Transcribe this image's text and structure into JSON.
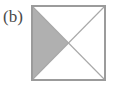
{
  "figure": {
    "panel_label": "(b)",
    "background_color": "#ffffff",
    "caption_color": "#4a4a4a"
  },
  "diagram": {
    "shape_name": "square",
    "outline_color": "#9b9b9b",
    "diagonal_color": "#a8a8a8",
    "fill_color": "#ffffff",
    "shaded_fill_color": "#b0b0b0",
    "outline_width": 2,
    "diagonal_width": 1,
    "square": {
      "left": 32,
      "top": 6,
      "right": 105,
      "bottom": 80
    },
    "center": {
      "x": 68.5,
      "y": 43
    },
    "corners": [
      {
        "name": "top-left",
        "x": 32,
        "y": 6
      },
      {
        "name": "top-right",
        "x": 105,
        "y": 6
      },
      {
        "name": "bottom-right",
        "x": 105,
        "y": 80
      },
      {
        "name": "bottom-left",
        "x": 32,
        "y": 80
      }
    ],
    "regions": [
      {
        "name": "left-triangle",
        "shaded": true,
        "points": "32,6 68.5,43 32,80"
      },
      {
        "name": "top-triangle",
        "shaded": false,
        "points": "32,6 105,6 68.5,43"
      },
      {
        "name": "right-triangle",
        "shaded": false,
        "points": "105,6 105,80 68.5,43"
      },
      {
        "name": "bottom-triangle",
        "shaded": false,
        "points": "32,80 105,80 68.5,43"
      }
    ]
  }
}
